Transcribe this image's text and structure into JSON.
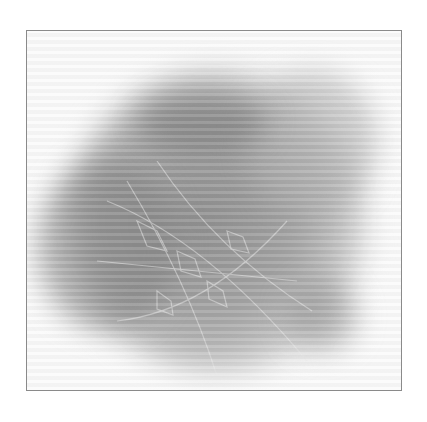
{
  "image": {
    "subject": "skeletonized physalis husk (leaf vein lattice) in grayscale",
    "frame_color": "#8a8a8a",
    "background_color": "#ffffff",
    "tone": "grayscale"
  }
}
